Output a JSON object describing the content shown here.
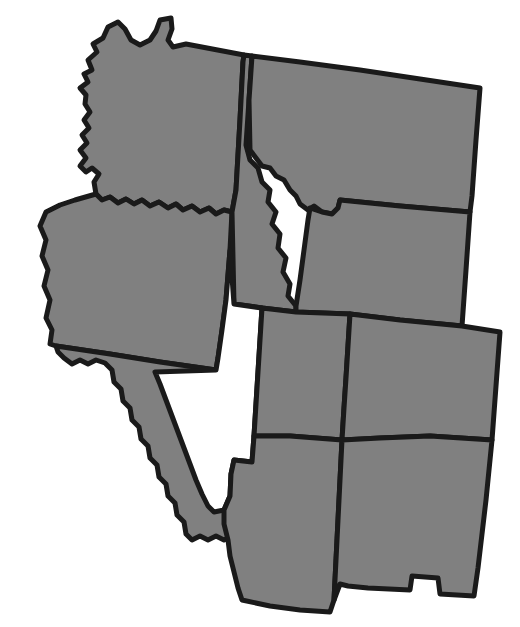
{
  "map": {
    "title": "Western United States",
    "region_label": "Western US States",
    "background_color": "#ffffff",
    "border_color": "#1a1a1a",
    "border_width": 5,
    "default_fill": "#808080",
    "highlight_fill": "#ffffff",
    "width": 520,
    "height": 627,
    "rotation_note": "slight clockwise tilt",
    "legend": {
      "filled_label": "Filled state",
      "highlighted_label": "Highlighted state",
      "highlighted_state": "Nevada"
    },
    "states": [
      {
        "id": "washington",
        "name": "Washington",
        "abbr": "WA",
        "fill": "#808080",
        "highlighted": false,
        "path": "M 86,95 L 80,88 L 88,82 L 84,74 L 92,70 L 88,60 L 97,52 L 93,44 L 103,38 L 108,27 L 118,22 L 125,29 L 131,40 L 140,45 L 150,40 L 156,31 L 160,20 L 171,18 L 172,29 L 168,40 L 173,47 L 186,44 L 244,55 L 243,62 L 240,120 L 236,190 L 232,212 L 224,210 L 216,214 L 209,208 L 200,212 L 192,206 L 183,210 L 176,204 L 168,208 L 159,202 L 150,206 L 142,200 L 134,204 L 126,199 L 118,203 L 110,197 L 102,200 L 96,194 L 94,182 L 99,174 L 92,168 L 86,172 L 80,166 L 86,158 L 80,150 L 87,143 L 82,135 L 89,128 L 84,120 L 90,112 L 85,104 Z"
      },
      {
        "id": "oregon",
        "name": "Oregon",
        "abbr": "OR",
        "fill": "#808080",
        "highlighted": false,
        "path": "M 96,194 L 102,200 L 110,197 L 118,203 L 126,199 L 134,204 L 142,200 L 150,206 L 159,202 L 168,208 L 176,204 L 183,210 L 192,206 L 200,212 L 209,208 L 216,214 L 224,210 L 232,212 L 230,250 L 226,300 L 222,330 L 218,358 L 216,370 L 160,362 L 110,354 L 56,346 L 50,344 L 52,330 L 46,318 L 50,300 L 44,286 L 48,270 L 42,256 L 46,240 L 40,226 L 46,212 L 60,205 L 75,200 Z"
      },
      {
        "id": "idaho",
        "name": "Idaho",
        "abbr": "ID",
        "fill": "#808080",
        "highlighted": false,
        "path": "M 244,55 L 252,56 L 249,100 L 246,145 L 250,160 L 258,168 L 262,182 L 270,190 L 268,202 L 276,212 L 272,224 L 280,234 L 278,248 L 286,258 L 283,272 L 290,284 L 288,296 L 296,306 L 296,312 L 262,308 L 234,304 L 232,212 L 236,190 L 240,120 L 243,62 Z"
      },
      {
        "id": "montana",
        "name": "Montana",
        "abbr": "MT",
        "fill": "#808080",
        "highlighted": false,
        "path": "M 252,56 L 300,62 L 360,70 L 420,79 L 480,88 L 476,140 L 472,196 L 470,212 L 400,206 L 340,200 L 338,208 L 332,214 L 322,212 L 314,206 L 308,210 L 300,204 L 296,196 L 290,190 L 284,180 L 276,176 L 270,168 L 262,166 L 256,158 L 250,150 L 249,100 Z"
      },
      {
        "id": "wyoming",
        "name": "Wyoming",
        "abbr": "WY",
        "fill": "#808080",
        "highlighted": false,
        "path": "M 340,200 L 400,206 L 470,212 L 466,270 L 462,326 L 400,320 L 350,314 L 296,312 L 296,306 L 300,280 L 304,250 L 308,220 L 310,208 L 322,212 L 332,214 L 338,208 Z"
      },
      {
        "id": "california",
        "name": "California",
        "abbr": "CA",
        "fill": "#808080",
        "highlighted": false,
        "path": "M 56,346 L 110,354 L 160,362 L 216,370 L 220,386 L 226,404 L 232,420 L 238,436 L 244,452 L 250,468 L 256,484 L 262,500 L 268,514 L 274,526 L 280,536 L 272,540 L 264,536 L 256,540 L 248,536 L 240,540 L 232,536 L 224,540 L 216,536 L 208,540 L 200,536 L 192,540 L 186,534 L 184,522 L 177,515 L 175,503 L 168,496 L 166,484 L 159,477 L 157,465 L 150,458 L 148,446 L 141,439 L 139,427 L 132,420 L 130,408 L 123,401 L 121,389 L 114,382 L 112,370 L 105,363 L 96,360 L 88,364 L 80,360 L 72,364 L 64,358 L 58,352 Z"
      },
      {
        "id": "nevada",
        "name": "Nevada",
        "abbr": "NV",
        "fill": "#ffffff",
        "highlighted": true,
        "path": "M 216,370 L 218,358 L 222,330 L 226,300 L 230,250 L 234,304 L 262,308 L 260,340 L 258,372 L 256,404 L 254,436 L 252,462 L 234,460 L 231,474 L 230,496 L 224,510 L 214,512 L 208,506 L 202,494 L 196,480 L 190,464 L 184,448 L 178,432 L 172,416 L 166,400 L 160,384 L 155,372 Z"
      },
      {
        "id": "utah",
        "name": "Utah",
        "abbr": "UT",
        "fill": "#808080",
        "highlighted": false,
        "path": "M 262,308 L 296,312 L 350,314 L 348,346 L 346,378 L 344,408 L 342,440 L 290,436 L 254,436 L 256,404 L 258,372 L 260,340 Z"
      },
      {
        "id": "colorado",
        "name": "Colorado",
        "abbr": "CO",
        "fill": "#808080",
        "highlighted": false,
        "path": "M 350,314 L 400,320 L 462,326 L 500,332 L 496,386 L 492,440 L 430,436 L 380,438 L 342,440 L 344,408 L 346,378 L 348,346 Z"
      },
      {
        "id": "arizona",
        "name": "Arizona",
        "abbr": "AZ",
        "fill": "#808080",
        "highlighted": false,
        "path": "M 254,436 L 290,436 L 342,440 L 340,480 L 338,520 L 336,560 L 334,600 L 330,612 L 300,610 L 270,606 L 242,600 L 238,588 L 234,572 L 230,556 L 228,540 L 224,524 L 224,510 L 230,496 L 231,474 L 234,460 L 252,462 Z"
      },
      {
        "id": "new-mexico",
        "name": "New Mexico",
        "abbr": "NM",
        "fill": "#808080",
        "highlighted": false,
        "path": "M 342,440 L 380,438 L 430,436 L 492,440 L 489,470 L 486,500 L 482,534 L 478,568 L 474,596 L 440,594 L 438,578 L 412,576 L 410,590 L 368,588 L 348,586 L 340,584 L 334,600 L 336,560 L 338,520 L 340,480 Z"
      }
    ]
  }
}
